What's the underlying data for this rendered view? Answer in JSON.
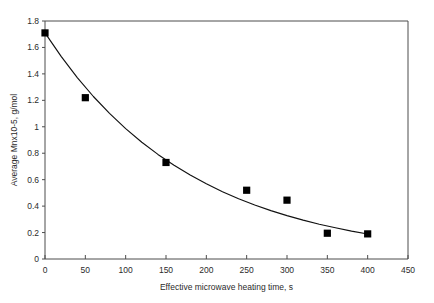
{
  "chart_data": {
    "type": "scatter",
    "title": "",
    "xlabel": "Effective microwave heating time, s",
    "ylabel": "Average Mnx10-5, g/mol",
    "xlim": [
      0,
      450
    ],
    "ylim": [
      0,
      1.8
    ],
    "xticks": [
      0,
      50,
      100,
      150,
      200,
      250,
      300,
      350,
      400,
      450
    ],
    "xtick_labels": [
      "0",
      "50",
      "100",
      "150",
      "200",
      "250",
      "300",
      "350",
      "400",
      "450"
    ],
    "yticks": [
      0,
      0.2,
      0.4,
      0.6,
      0.8,
      1,
      1.2,
      1.4,
      1.6,
      1.8
    ],
    "ytick_labels": [
      "0",
      "0.2",
      "0.4",
      "0.6",
      "0.8",
      "1",
      "1.2",
      "1.4",
      "1.6",
      "1.8"
    ],
    "grid": false,
    "legend": false,
    "marker_style": "filled-square",
    "marker_color": "#000000",
    "curve_color": "#111111",
    "axis_color": "#4d4d4d",
    "x": [
      0,
      50,
      150,
      250,
      300,
      350,
      400
    ],
    "values": [
      1.71,
      1.22,
      0.73,
      0.52,
      0.445,
      0.195,
      0.19
    ],
    "series": [
      {
        "name": "Average Mn",
        "x": [
          0,
          50,
          150,
          250,
          300,
          350,
          400
        ],
        "values": [
          1.71,
          1.22,
          0.73,
          0.52,
          0.445,
          0.195,
          0.19
        ]
      }
    ],
    "fit_curve": {
      "name": "exponential decay fit",
      "equation": "y = 1.71 * exp(-0.0055 * x)",
      "x": [
        0,
        20,
        40,
        60,
        80,
        100,
        120,
        140,
        160,
        180,
        200,
        220,
        240,
        260,
        280,
        300,
        320,
        340,
        360,
        380,
        400
      ],
      "values": [
        1.71,
        1.532,
        1.372,
        1.229,
        1.101,
        0.986,
        0.883,
        0.791,
        0.709,
        0.635,
        0.569,
        0.509,
        0.456,
        0.409,
        0.366,
        0.328,
        0.294,
        0.263,
        0.236,
        0.211,
        0.189
      ]
    }
  }
}
